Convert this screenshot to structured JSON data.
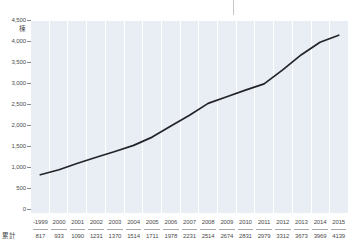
{
  "chart_data": {
    "type": "line",
    "title": "",
    "unit_label": "棟",
    "categories": [
      "-1999",
      "2000",
      "2001",
      "2002",
      "2003",
      "2004",
      "2005",
      "2006",
      "2007",
      "2008",
      "2009",
      "2010",
      "2011",
      "2012",
      "2013",
      "2014",
      "2015"
    ],
    "values": [
      817,
      933,
      1090,
      1231,
      1370,
      1514,
      1711,
      1978,
      2231,
      2514,
      2674,
      2831,
      2979,
      3312,
      3673,
      3969,
      4139
    ],
    "series_name": "累計",
    "y_ticks": [
      {
        "value": 0,
        "label": "0"
      },
      {
        "value": 500,
        "label": "500"
      },
      {
        "value": 1000,
        "label": "1,000"
      },
      {
        "value": 1500,
        "label": "1,500"
      },
      {
        "value": 2000,
        "label": "2,000"
      },
      {
        "value": 2500,
        "label": "2,500"
      },
      {
        "value": 3000,
        "label": "3,000"
      },
      {
        "value": 3500,
        "label": "3,500"
      },
      {
        "value": 4000,
        "label": "4,000"
      },
      {
        "value": 4500,
        "label": "4,500"
      }
    ],
    "ylim": [
      0,
      4500
    ],
    "xlabel": "",
    "ylabel": "棟",
    "legend": "none",
    "grid": "vertical-column-bands",
    "table_row_label": "累計",
    "colors": {
      "plot_background": "#e9edf4",
      "column_gap": "#ffffff",
      "line": "#23232a",
      "text": "#4d4d4d",
      "tick": "#8a8a8a",
      "divider": "#aaaaaa"
    }
  }
}
